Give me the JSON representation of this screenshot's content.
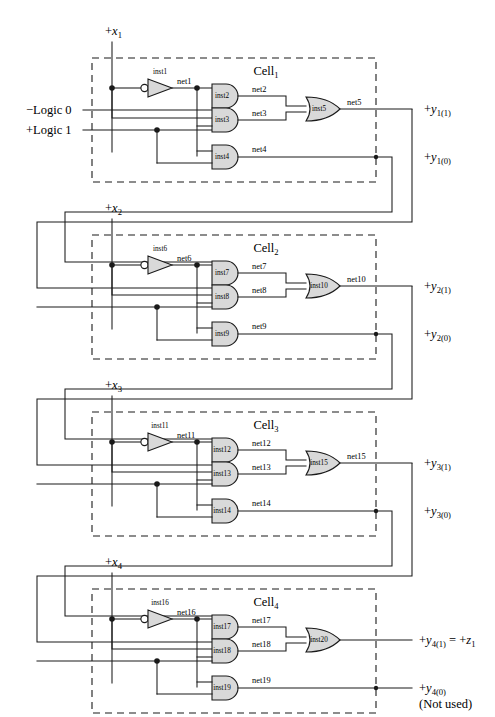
{
  "inputs": {
    "clock_labels": [
      "+x",
      "+x",
      "+x",
      "+x"
    ],
    "clock_subs": [
      "1",
      "2",
      "3",
      "4"
    ],
    "rails": [
      {
        "name": "logic0",
        "label": "−Logic 0"
      },
      {
        "name": "logic1",
        "label": "+Logic 1"
      }
    ]
  },
  "cells": [
    {
      "id": "cell1",
      "name": "Cell",
      "subscript": "1",
      "inverter": {
        "inst": "inst1",
        "out_net": "net1"
      },
      "and_gates": [
        {
          "inst": "inst2",
          "out_net": "net2"
        },
        {
          "inst": "inst3",
          "out_net": "net3"
        },
        {
          "inst": "inst4",
          "out_net": "net4"
        }
      ],
      "or_gate": {
        "inst": "inst5",
        "out_net": "net5"
      },
      "outputs": [
        {
          "name": "y1_1",
          "prefix": "+",
          "var": "y",
          "sub": "1(1)"
        },
        {
          "name": "y1_0",
          "prefix": "+",
          "var": "y",
          "sub": "1(0)"
        }
      ]
    },
    {
      "id": "cell2",
      "name": "Cell",
      "subscript": "2",
      "inverter": {
        "inst": "inst6",
        "out_net": "net6"
      },
      "and_gates": [
        {
          "inst": "inst7",
          "out_net": "net7"
        },
        {
          "inst": "inst8",
          "out_net": "net8"
        },
        {
          "inst": "inst9",
          "out_net": "net9"
        }
      ],
      "or_gate": {
        "inst": "inst10",
        "out_net": "net10"
      },
      "outputs": [
        {
          "name": "y2_1",
          "prefix": "+",
          "var": "y",
          "sub": "2(1)"
        },
        {
          "name": "y2_0",
          "prefix": "+",
          "var": "y",
          "sub": "2(0)"
        }
      ]
    },
    {
      "id": "cell3",
      "name": "Cell",
      "subscript": "3",
      "inverter": {
        "inst": "inst11",
        "out_net": "net11"
      },
      "and_gates": [
        {
          "inst": "inst12",
          "out_net": "net12"
        },
        {
          "inst": "inst13",
          "out_net": "net13"
        },
        {
          "inst": "inst14",
          "out_net": "net14"
        }
      ],
      "or_gate": {
        "inst": "inst15",
        "out_net": "net15"
      },
      "outputs": [
        {
          "name": "y3_1",
          "prefix": "+",
          "var": "y",
          "sub": "3(1)"
        },
        {
          "name": "y3_0",
          "prefix": "+",
          "var": "y",
          "sub": "3(0)"
        }
      ]
    },
    {
      "id": "cell4",
      "name": "Cell",
      "subscript": "4",
      "inverter": {
        "inst": "inst16",
        "out_net": "net16"
      },
      "and_gates": [
        {
          "inst": "inst17",
          "out_net": "net17"
        },
        {
          "inst": "inst18",
          "out_net": "net18"
        },
        {
          "inst": "inst19",
          "out_net": "net19"
        }
      ],
      "or_gate": {
        "inst": "inst20",
        "out_net": ""
      },
      "outputs": [
        {
          "name": "y4_1",
          "prefix": "+",
          "var": "y",
          "sub": "4(1)",
          "equals": "=",
          "alias_prefix": "+",
          "alias_var": "z",
          "alias_sub": "1"
        },
        {
          "name": "y4_0",
          "prefix": "+",
          "var": "y",
          "sub": "4(0)",
          "note": "(Not used)"
        }
      ]
    }
  ],
  "colors": {
    "gate_fill": "#d9d9d9",
    "line": "#1a1a1a",
    "background": "#ffffff"
  }
}
